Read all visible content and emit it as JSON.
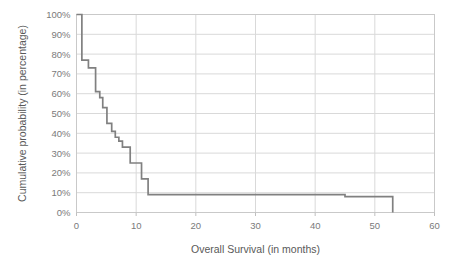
{
  "chart_data": {
    "type": "line",
    "subtype": "kaplan-meier-step",
    "title": "",
    "xlabel": "Overall Survival (in months)",
    "ylabel": "Cumulative probability (in percentage)",
    "xlim": [
      0,
      60
    ],
    "ylim": [
      0,
      100
    ],
    "xticks": [
      0,
      10,
      20,
      30,
      40,
      50,
      60
    ],
    "xtick_labels": [
      "0",
      "10",
      "20",
      "30",
      "40",
      "50",
      "60"
    ],
    "yticks": [
      0,
      10,
      20,
      30,
      40,
      50,
      60,
      70,
      80,
      90,
      100
    ],
    "ytick_labels": [
      "0%",
      "10%",
      "20%",
      "30%",
      "40%",
      "50%",
      "60%",
      "70%",
      "80%",
      "90%",
      "100%"
    ],
    "grid": true,
    "grid_axis": "both",
    "legend": false,
    "legend_position": "none",
    "line_color": "#808080",
    "grid_color": "#d9d9d9",
    "axis_color": "#bfbfbf",
    "plot_background": "#ffffff",
    "series": [
      {
        "name": "Cumulative survival probability",
        "step_points": [
          [
            0,
            100
          ],
          [
            0.9,
            100
          ],
          [
            0.9,
            77
          ],
          [
            2.0,
            77
          ],
          [
            2.0,
            73
          ],
          [
            3.2,
            73
          ],
          [
            3.2,
            61
          ],
          [
            3.9,
            61
          ],
          [
            3.9,
            58
          ],
          [
            4.4,
            58
          ],
          [
            4.4,
            53
          ],
          [
            5.1,
            53
          ],
          [
            5.1,
            45
          ],
          [
            5.9,
            45
          ],
          [
            5.9,
            41
          ],
          [
            6.5,
            41
          ],
          [
            6.5,
            38
          ],
          [
            7.1,
            38
          ],
          [
            7.1,
            36
          ],
          [
            7.7,
            36
          ],
          [
            7.7,
            33
          ],
          [
            9.0,
            33
          ],
          [
            9.0,
            25
          ],
          [
            10.9,
            25
          ],
          [
            10.9,
            17
          ],
          [
            12.0,
            17
          ],
          [
            12.0,
            9
          ],
          [
            45.0,
            9
          ],
          [
            45.0,
            8
          ],
          [
            53.0,
            8
          ],
          [
            53.0,
            0
          ]
        ]
      }
    ]
  },
  "axes": {
    "x_title": "Overall Survival (in months)",
    "y_title": "Cumulative probability (in percentage)"
  }
}
